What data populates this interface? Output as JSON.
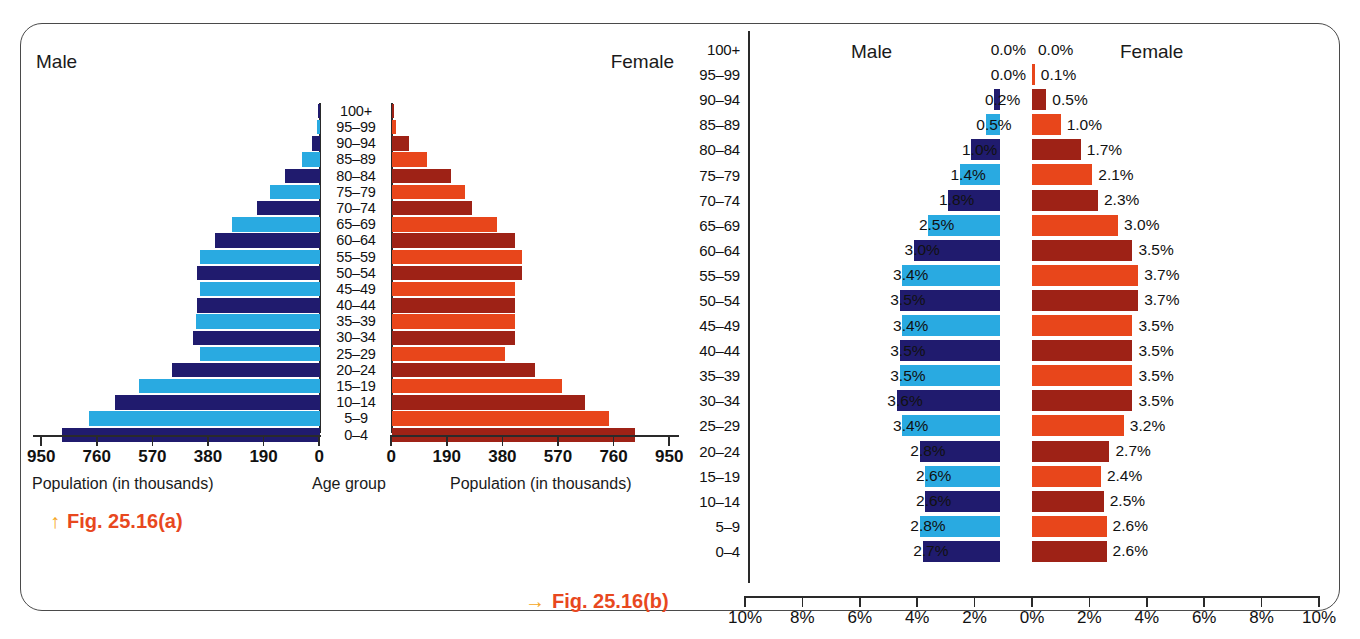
{
  "figure": {
    "panel_a_label": "Fig. 25.16(a)",
    "panel_a_arrow": "↑",
    "panel_b_label": "Fig. 25.16(b)",
    "panel_b_arrow": "→",
    "accent_color": "#E8481E",
    "arrow_color": "#F5A623"
  },
  "colors": {
    "male_light": "#29AAE1",
    "male_dark": "#201B6E",
    "female_light": "#E8461B",
    "female_dark": "#9E2216"
  },
  "chart_a": {
    "male_label": "Male",
    "female_label": "Female",
    "left_caption": "Population (in thousands)",
    "center_caption": "Age group",
    "right_caption": "Population (in thousands)",
    "left_ticks": [
      "950",
      "760",
      "570",
      "380",
      "190",
      "0"
    ],
    "right_ticks": [
      "0",
      "190",
      "380",
      "570",
      "760",
      "950"
    ]
  },
  "chart_b": {
    "male_label": "Male",
    "female_label": "Female",
    "ticks": [
      "10%",
      "8%",
      "6%",
      "4%",
      "2%",
      "0%",
      "2%",
      "4%",
      "6%",
      "8%",
      "10%"
    ]
  },
  "chart_data": [
    {
      "type": "bar",
      "orientation": "population-pyramid",
      "title": "Fig. 25.16(a)",
      "xlabel": "Population (in thousands)",
      "ylabel": "Age group",
      "xlim": [
        0,
        950
      ],
      "xticks": [
        0,
        190,
        380,
        570,
        760,
        950
      ],
      "grid": false,
      "categories": [
        "100+",
        "95–99",
        "90–94",
        "85–89",
        "80–84",
        "75–79",
        "70–74",
        "65–69",
        "60–64",
        "55–59",
        "50–54",
        "45–49",
        "40–44",
        "35–39",
        "30–34",
        "25–29",
        "20–24",
        "15–19",
        "10–14",
        "5–9",
        "0–4"
      ],
      "series": [
        {
          "name": "Male",
          "values": [
            3,
            12,
            28,
            62,
            120,
            170,
            215,
            300,
            360,
            410,
            420,
            410,
            420,
            425,
            435,
            410,
            505,
            620,
            700,
            790,
            880
          ]
        },
        {
          "name": "Female",
          "values": [
            4,
            15,
            58,
            120,
            200,
            250,
            275,
            360,
            420,
            445,
            445,
            420,
            420,
            420,
            420,
            385,
            490,
            580,
            660,
            740,
            830
          ]
        }
      ]
    },
    {
      "type": "bar",
      "orientation": "population-pyramid",
      "title": "Fig. 25.16(b)",
      "xlabel": "Percent of total population",
      "ylabel": "Age group",
      "xlim": [
        0,
        10
      ],
      "xticks": [
        10,
        8,
        6,
        4,
        2,
        0,
        2,
        4,
        6,
        8,
        10
      ],
      "xtick_labels": [
        "10%",
        "8%",
        "6%",
        "4%",
        "2%",
        "0%",
        "2%",
        "4%",
        "6%",
        "8%",
        "10%"
      ],
      "grid": false,
      "categories": [
        "100+",
        "95–99",
        "90–94",
        "85–89",
        "80–84",
        "75–79",
        "70–74",
        "65–69",
        "60–64",
        "55–59",
        "50–54",
        "45–49",
        "40–44",
        "35–39",
        "30–34",
        "25–29",
        "20–24",
        "15–19",
        "10–14",
        "5–9",
        "0–4"
      ],
      "series": [
        {
          "name": "Male",
          "values": [
            0.0,
            0.0,
            0.2,
            0.5,
            1.0,
            1.4,
            1.8,
            2.5,
            3.0,
            3.4,
            3.5,
            3.4,
            3.5,
            3.5,
            3.6,
            3.4,
            2.8,
            2.6,
            2.6,
            2.8,
            2.7
          ]
        },
        {
          "name": "Female",
          "values": [
            0.0,
            0.1,
            0.5,
            1.0,
            1.7,
            2.1,
            2.3,
            3.0,
            3.5,
            3.7,
            3.7,
            3.5,
            3.5,
            3.5,
            3.5,
            3.2,
            2.7,
            2.4,
            2.5,
            2.6,
            2.6
          ]
        }
      ],
      "male_labels": [
        "0.0%",
        "0.0%",
        "0.2%",
        "0.5%",
        "1.0%",
        "1.4%",
        "1.8%",
        "2.5%",
        "3.0%",
        "3.4%",
        "3.5%",
        "3.4%",
        "3.5%",
        "3.5%",
        "3.6%",
        "3.4%",
        "2.8%",
        "2.6%",
        "2.6%",
        "2.8%",
        "2.7%"
      ],
      "female_labels": [
        "0.0%",
        "0.1%",
        "0.5%",
        "1.0%",
        "1.7%",
        "2.1%",
        "2.3%",
        "3.0%",
        "3.5%",
        "3.7%",
        "3.7%",
        "3.5%",
        "3.5%",
        "3.5%",
        "3.5%",
        "3.2%",
        "2.7%",
        "2.4%",
        "2.5%",
        "2.6%",
        "2.6%"
      ]
    }
  ]
}
